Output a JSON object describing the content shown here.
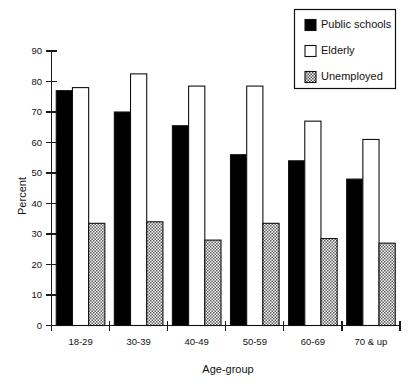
{
  "chart_data": {
    "type": "bar",
    "title": "",
    "subtitle": "",
    "xlabel": "Age-group",
    "ylabel": "Percent",
    "categories": [
      "18-29",
      "30-39",
      "40-49",
      "50-59",
      "60-69",
      "70 & up"
    ],
    "series": [
      {
        "name": "Public schools",
        "values": [
          77,
          70,
          65.5,
          56,
          54,
          48
        ],
        "style": "solid-black",
        "color": "#000000"
      },
      {
        "name": "Elderly",
        "values": [
          78,
          82.5,
          78.5,
          78.5,
          67,
          61
        ],
        "style": "open-white",
        "color": "#ffffff"
      },
      {
        "name": "Unemployed",
        "values": [
          33.5,
          34,
          28,
          33.5,
          28.5,
          27
        ],
        "style": "hatched-gray",
        "color": "#9a9a9a"
      }
    ],
    "ylim": [
      0,
      90
    ],
    "yticks": [
      0,
      10,
      20,
      30,
      40,
      50,
      60,
      70,
      80,
      90
    ],
    "ytick_labels": [
      "0",
      "10",
      "20",
      "30",
      "40",
      "50",
      "60",
      "70",
      "80",
      "90"
    ],
    "grid": false,
    "legend_position": "top-right",
    "legend_entries": [
      "Public schools",
      "Elderly",
      "Unemployed"
    ]
  }
}
